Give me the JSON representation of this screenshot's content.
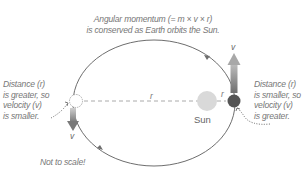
{
  "title": {
    "line1": "Angular momentum (= m × v × r)",
    "line2": "is conserved as Earth orbits the Sun."
  },
  "left_note": {
    "line1": "Distance (r)",
    "line2": "is greater, so",
    "line3": "velocity (v)",
    "line4": "is smaller."
  },
  "right_note": {
    "line1": "Distance (r)",
    "line2": "is smaller, so",
    "line3": "velocity (v)",
    "line4": "is greater."
  },
  "sun_label": "Sun",
  "distance_label_far": "r",
  "distance_label_near": "r",
  "velocity_label_far": "v",
  "velocity_label_near": "v",
  "footnote": "Not to scale!",
  "colors": {
    "orbit": "#6e6e6e",
    "sun": "#d9d9d9",
    "earth_near": "#555555",
    "earth_far": "#ffffff",
    "arrow": "#8a8a8a",
    "text": "#777777"
  }
}
